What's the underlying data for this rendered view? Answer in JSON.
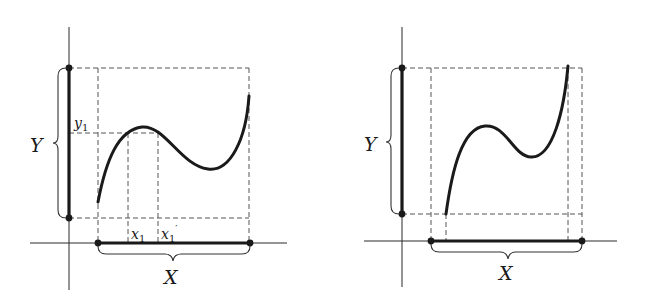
{
  "figure": {
    "panels": [
      {
        "id": "left",
        "labels": {
          "Y": "Y",
          "X": "X",
          "y1": "y",
          "y1_sub": "1",
          "x1": "x",
          "x1_sub": "1",
          "x1p": "x",
          "x1p_sub": "1",
          "x1p_prime": "′"
        }
      },
      {
        "id": "right",
        "labels": {
          "Y": "Y",
          "X": "X"
        }
      }
    ]
  }
}
